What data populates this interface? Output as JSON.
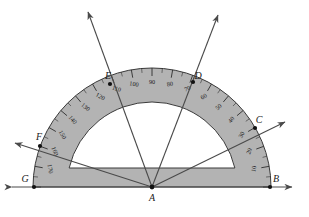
{
  "figure": {
    "background_color": "#ffffff",
    "protractor": {
      "body_fill": "#b3b3b3",
      "body_stroke": "#3a3a3a",
      "inner_cutout_fill": "#ffffff",
      "center_x": 152,
      "center_y": 187,
      "outer_radius": 119,
      "inner_radius": 85,
      "scale_ring_radius": 104,
      "cutout_flat_y": 168,
      "tick_minor_step_deg": 5,
      "tick_major_step_deg": 10,
      "degree_labels": [
        "10",
        "20",
        "30",
        "40",
        "50",
        "60",
        "70",
        "80",
        "90",
        "100",
        "110",
        "120",
        "130",
        "140",
        "150",
        "160",
        "170"
      ],
      "degree_label_values": [
        10,
        20,
        30,
        40,
        50,
        60,
        70,
        80,
        90,
        100,
        110,
        120,
        130,
        140,
        150,
        160,
        170
      ]
    },
    "vertex": {
      "label": "A",
      "x": 152,
      "y": 187
    },
    "baseline": {
      "label_left": "G",
      "label_right": "B",
      "left_x": 34,
      "right_x": 270,
      "y": 187,
      "arrow_both_ends": true
    },
    "points": [
      {
        "label": "B",
        "angle_deg": 0,
        "on_baseline": true,
        "x": 270,
        "y": 187,
        "label_dx": 6,
        "label_dy": -5
      },
      {
        "label": "C",
        "angle_deg": 30,
        "on_baseline": false,
        "x": 255,
        "y": 128,
        "label_dx": 4,
        "label_dy": -5
      },
      {
        "label": "D",
        "angle_deg": 70,
        "on_baseline": false,
        "x": 193,
        "y": 82,
        "label_dx": 5,
        "label_dy": -3
      },
      {
        "label": "E",
        "angle_deg": 120,
        "on_baseline": false,
        "x": 110,
        "y": 84,
        "label_dx": -2,
        "label_dy": -5
      },
      {
        "label": "F",
        "angle_deg": 160,
        "on_baseline": false,
        "x": 40,
        "y": 146,
        "label_dx": -1,
        "label_dy": -6
      },
      {
        "label": "G",
        "angle_deg": 180,
        "on_baseline": true,
        "x": 34,
        "y": 187,
        "label_dx": -9,
        "label_dy": -5
      }
    ],
    "rays": [
      {
        "through": "C",
        "angle_deg": 30,
        "tip_x": 285,
        "tip_y": 122,
        "arrow": true
      },
      {
        "through": "D",
        "angle_deg": 70,
        "tip_x": 218,
        "tip_y": 15,
        "arrow": true
      },
      {
        "through": "E",
        "angle_deg": 120,
        "tip_x": 88,
        "tip_y": 12,
        "arrow": true
      },
      {
        "through": "F",
        "angle_deg": 160,
        "tip_x": 15,
        "tip_y": 143,
        "arrow": true
      }
    ],
    "chord_lines": [
      {
        "from": "F",
        "to": "C",
        "note": "line through A region crossing cutout"
      }
    ]
  }
}
